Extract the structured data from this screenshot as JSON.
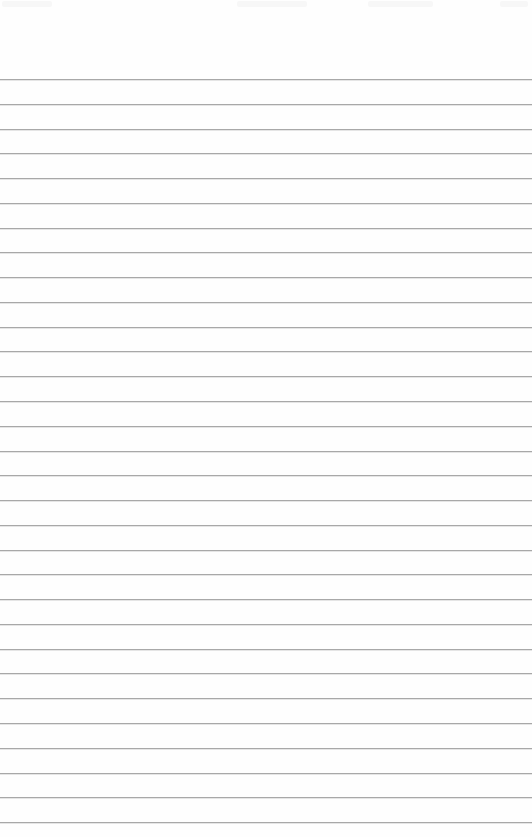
{
  "document": {
    "type": "ruled-paper",
    "background_color": "#fefefe",
    "rule_color": "#a8a8a8",
    "rules": {
      "count": 31,
      "first_y": 79,
      "spacing": 24.77
    },
    "text_content": []
  }
}
